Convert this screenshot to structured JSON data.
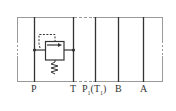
{
  "diagram": {
    "ports": [
      {
        "id": "P",
        "label": "P"
      },
      {
        "id": "T",
        "label": "T"
      },
      {
        "id": "P1",
        "label": "P",
        "sub": "1",
        "paren": "(T",
        "paren_sub": "1",
        "paren_close": ")"
      },
      {
        "id": "B",
        "label": "B"
      },
      {
        "id": "A",
        "label": "A"
      }
    ],
    "components": [
      {
        "type": "relief-valve",
        "from": "P",
        "to": "T",
        "spring": true,
        "pilot": "dashed"
      }
    ],
    "colors": {
      "line": "#333333",
      "frame": "#9a9a9a",
      "background": "#ffffff"
    }
  }
}
